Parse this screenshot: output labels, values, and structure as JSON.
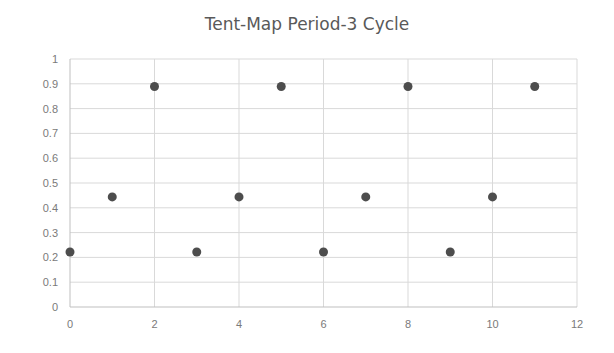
{
  "chart_data": {
    "type": "scatter",
    "title": "Tent-Map Period-3 Cycle",
    "xlabel": "",
    "ylabel": "",
    "xlim": [
      0,
      12
    ],
    "ylim": [
      0,
      1
    ],
    "x_ticks": [
      0,
      2,
      4,
      6,
      8,
      10,
      12
    ],
    "y_ticks": [
      0,
      0.1,
      0.2,
      0.3,
      0.4,
      0.5,
      0.6,
      0.7,
      0.8,
      0.9,
      1
    ],
    "y_tick_labels": [
      "0",
      "0.1",
      "0.2",
      "0.3",
      "0.4",
      "0.5",
      "0.6",
      "0.7",
      "0.8",
      "0.9",
      "1"
    ],
    "grid": true,
    "legend": null,
    "series": [
      {
        "name": "Series1",
        "color": "#4d4d4d",
        "x": [
          0,
          1,
          2,
          3,
          4,
          5,
          6,
          7,
          8,
          9,
          10,
          11
        ],
        "y": [
          0.222,
          0.444,
          0.889,
          0.222,
          0.444,
          0.889,
          0.222,
          0.444,
          0.889,
          0.222,
          0.444,
          0.889
        ]
      }
    ]
  },
  "colors": {
    "marker": "#4d4d4d",
    "gridline": "#d9d9d9",
    "axis": "#bfbfbf",
    "text": "#7a7a7a",
    "title": "#595959"
  }
}
